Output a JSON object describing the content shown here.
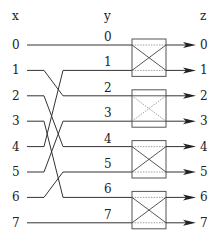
{
  "headers": {
    "x": "x",
    "y": "y",
    "z": "z"
  },
  "x_labels": [
    "0",
    "1",
    "2",
    "3",
    "4",
    "5",
    "6",
    "7"
  ],
  "y_labels": [
    "0",
    "1",
    "2",
    "3",
    "4",
    "5",
    "6",
    "7"
  ],
  "z_labels": [
    "0",
    "1",
    "2",
    "3",
    "4",
    "5",
    "6",
    "7"
  ],
  "wiring_x_to_y": [
    {
      "from": 0,
      "to": 0
    },
    {
      "from": 1,
      "to": 2
    },
    {
      "from": 2,
      "to": 4
    },
    {
      "from": 3,
      "to": 6
    },
    {
      "from": 4,
      "to": 1
    },
    {
      "from": 5,
      "to": 3
    },
    {
      "from": 6,
      "to": 5
    },
    {
      "from": 7,
      "to": 7
    }
  ],
  "switches": [
    {
      "inputs": [
        0,
        1
      ],
      "state": "cross"
    },
    {
      "inputs": [
        2,
        3
      ],
      "state": "straight"
    },
    {
      "inputs": [
        4,
        5
      ],
      "state": "cross"
    },
    {
      "inputs": [
        6,
        7
      ],
      "state": "cross"
    }
  ]
}
